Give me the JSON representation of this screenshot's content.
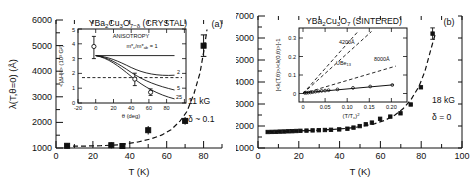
{
  "figure": {
    "panels": [
      {
        "id": "a",
        "letter": "(a)",
        "title_main": "YBa",
        "title_sub1": "2",
        "title_mid": "Cu",
        "title_sub2": "3",
        "title_mid2": "O",
        "title_sub3": "7−δ",
        "title_tail": " (CRYSTAL)",
        "title_full": "YBa2Cu3O7−δ (CRYSTAL)",
        "xlabel": "T (K)",
        "ylabel": "λ(T, θ=0)  (Å)",
        "xticks": [
          "0",
          "20",
          "40",
          "60",
          "80"
        ],
        "yticks": [
          "1000",
          "2000",
          "3000",
          "4000",
          "5000",
          "6000"
        ],
        "xlim": [
          0,
          90
        ],
        "ylim": [
          1000,
          6000
        ],
        "annotations": [
          "11 kG",
          "δ ~ 0.1"
        ],
        "data": {
          "type": "scatter",
          "x": [
            6,
            30,
            36,
            50,
            70,
            80
          ],
          "y": [
            1450,
            1470,
            1440,
            1790,
            2140,
            5090
          ],
          "yerr": [
            70,
            80,
            70,
            90,
            80,
            420
          ]
        },
        "fit_curve": {
          "x": [
            5,
            15,
            25,
            35,
            45,
            52,
            58,
            63,
            68,
            72,
            76,
            79,
            81,
            82.5
          ],
          "y": [
            1430,
            1440,
            1455,
            1490,
            1600,
            1720,
            1880,
            2080,
            2420,
            2800,
            3500,
            4300,
            5200,
            6000
          ]
        },
        "inset": {
          "title": "ANISOTROPY",
          "ratio_label": "m*c/m*ab = 1",
          "xlabel": "θ (deg)",
          "ylabel": "<|ΔH|²>   (10³ G²)",
          "xticks": [
            "-20",
            "0",
            "20",
            "40",
            "60",
            "80"
          ],
          "yticks": [
            "0",
            "1",
            "2",
            "3",
            "4",
            "5"
          ],
          "xlim": [
            -20,
            95
          ],
          "ylim": [
            0,
            5
          ],
          "curve_labels": [
            "2",
            "5",
            "25"
          ],
          "dashed_level": 1.72,
          "points": {
            "x": [
              -2,
              45,
              63
            ],
            "y": [
              3.82,
              1.55,
              0.72
            ],
            "yerr": [
              0.75,
              0.42,
              0.22
            ]
          },
          "series": [
            {
              "name": "1",
              "x": [
                0,
                10,
                20,
                30,
                40,
                50,
                60,
                70,
                80,
                90
              ],
              "y": [
                3.2,
                3.2,
                3.2,
                3.2,
                3.2,
                3.2,
                3.2,
                3.2,
                3.2,
                3.2
              ]
            },
            {
              "name": "2",
              "x": [
                0,
                10,
                20,
                30,
                40,
                50,
                60,
                70,
                80,
                90
              ],
              "y": [
                3.2,
                3.16,
                3.05,
                2.85,
                2.6,
                2.35,
                2.12,
                1.98,
                1.9,
                1.88
              ]
            },
            {
              "name": "5",
              "x": [
                0,
                10,
                20,
                30,
                40,
                50,
                60,
                70,
                80,
                90
              ],
              "y": [
                3.2,
                3.12,
                2.9,
                2.55,
                2.1,
                1.65,
                1.3,
                1.05,
                0.92,
                0.88
              ]
            },
            {
              "name": "25",
              "x": [
                0,
                10,
                20,
                30,
                40,
                50,
                60,
                70,
                80,
                90
              ],
              "y": [
                3.2,
                3.08,
                2.8,
                2.35,
                1.8,
                1.25,
                0.8,
                0.5,
                0.32,
                0.28
              ]
            }
          ]
        }
      },
      {
        "id": "b",
        "letter": "(b)",
        "title_full": "YBa2Cu3O7 (SINTERED)",
        "title_tail": " (SINTERED)",
        "xlabel": "T (K)",
        "ylabel": "",
        "xticks": [
          "0",
          "20",
          "40",
          "60",
          "80",
          "100"
        ],
        "yticks": [
          "1000",
          "2000",
          "3000",
          "4000",
          "5000",
          "6000",
          "7000"
        ],
        "xlim": [
          0,
          100
        ],
        "ylim": [
          1000,
          7000
        ],
        "annotations": [
          "18 kG",
          "δ = 0"
        ],
        "data": {
          "type": "scatter",
          "x": [
            5,
            7,
            9,
            11,
            13,
            15,
            17,
            19,
            21,
            24,
            27,
            30,
            33,
            36,
            40,
            44,
            47,
            50,
            53,
            56,
            60,
            65,
            70,
            75,
            80,
            85
          ],
          "y": [
            1740,
            1745,
            1750,
            1760,
            1765,
            1775,
            1780,
            1790,
            1800,
            1810,
            1820,
            1830,
            1840,
            1850,
            1870,
            1900,
            1950,
            2020,
            2100,
            2180,
            2350,
            2450,
            2600,
            3000,
            3780,
            6400
          ],
          "yerr": [
            40,
            40,
            40,
            40,
            40,
            40,
            40,
            40,
            40,
            40,
            40,
            40,
            40,
            40,
            40,
            40,
            40,
            45,
            45,
            50,
            55,
            60,
            70,
            90,
            140,
            260
          ]
        },
        "fit_curve": {
          "x": [
            5,
            15,
            25,
            35,
            45,
            52,
            58,
            63,
            68,
            72,
            76,
            80,
            83,
            86,
            88
          ],
          "y": [
            1740,
            1760,
            1790,
            1830,
            1900,
            1990,
            2110,
            2260,
            2500,
            2780,
            3200,
            3800,
            4500,
            5500,
            6400
          ]
        },
        "inset": {
          "xlabel": "(T/Tc)²",
          "ylabel": "[<λ(T,θ)>/<λ(0,θ)>]-1",
          "xticks": [
            "0",
            "0.05",
            "0.10",
            "0.15",
            "0.20"
          ],
          "yticks": [
            "0",
            "0.1",
            "0.2",
            "0.3"
          ],
          "xlim": [
            0,
            0.235
          ],
          "ylim": [
            -0.02,
            0.345
          ],
          "curve_labels": [
            "4200Å",
            "8000Å",
            "UBe13"
          ],
          "curve_label_sub": "13",
          "lines": [
            {
              "name": "4200Å",
              "style": "dashed",
              "x": [
                0,
                0.155
              ],
              "y": [
                0,
                0.335
              ]
            },
            {
              "name": "8000Å",
              "style": "dashed",
              "x": [
                0,
                0.21
              ],
              "y": [
                0,
                0.148
              ]
            },
            {
              "name": "UBe13",
              "style": "dashed",
              "x": [
                0,
                0.125
              ],
              "y": [
                0,
                0.335
              ]
            },
            {
              "name": "data-fit",
              "style": "solid",
              "x": [
                0,
                0.205
              ],
              "y": [
                0.003,
                0.047
              ]
            }
          ],
          "points": {
            "x": [
              0.004,
              0.008,
              0.012,
              0.017,
              0.022,
              0.028,
              0.035,
              0.042,
              0.05,
              0.058,
              0.078,
              0.113,
              0.152,
              0.202
            ],
            "y": [
              0.003,
              0.004,
              0.005,
              0.006,
              0.008,
              0.01,
              0.012,
              0.014,
              0.016,
              0.018,
              0.022,
              0.03,
              0.038,
              0.046
            ]
          }
        }
      }
    ]
  }
}
